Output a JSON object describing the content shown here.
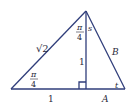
{
  "diagram": {
    "type": "geometry-triangle",
    "color": "#2f3d7a",
    "labels": {
      "hypotenuse_left": "√2",
      "angle_bottom_left_num": "π",
      "angle_bottom_left_den": "4",
      "angle_top_num": "π",
      "angle_top_den": "4",
      "angle_top_right": "s",
      "altitude": "1",
      "side_right": "B",
      "angle_bottom_right": "t",
      "base_left": "1",
      "base_right": "A"
    }
  }
}
